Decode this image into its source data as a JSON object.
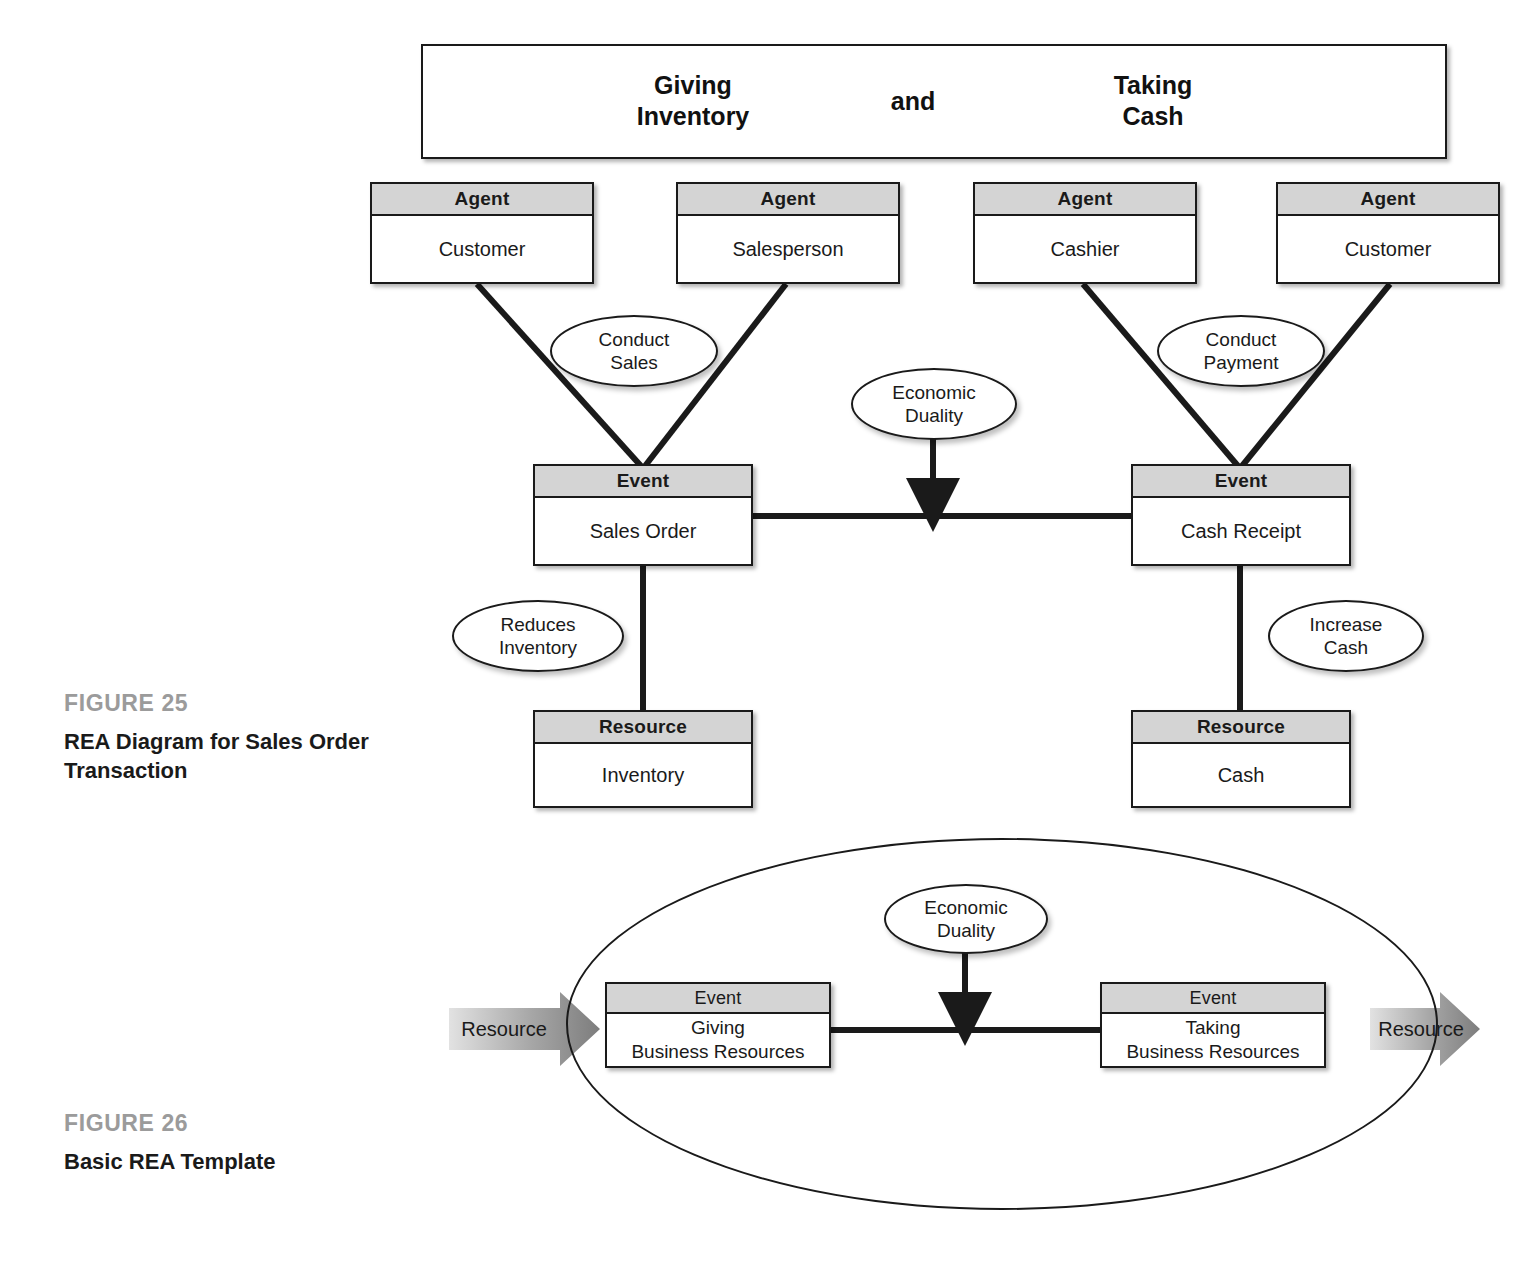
{
  "figure25": {
    "caption_number": "FIGURE 25",
    "caption_title": "REA Diagram for Sales Order Transaction",
    "banner": {
      "left": "Giving\nInventory",
      "left_line1": "Giving",
      "left_line2": "Inventory",
      "middle": "and",
      "right_line1": "Taking",
      "right_line2": "Cash"
    },
    "agents": [
      {
        "header": "Agent",
        "name": "Customer"
      },
      {
        "header": "Agent",
        "name": "Salesperson"
      },
      {
        "header": "Agent",
        "name": "Cashier"
      },
      {
        "header": "Agent",
        "name": "Customer"
      }
    ],
    "events": [
      {
        "header": "Event",
        "name": "Sales Order"
      },
      {
        "header": "Event",
        "name": "Cash Receipt"
      }
    ],
    "resources": [
      {
        "header": "Resource",
        "name": "Inventory"
      },
      {
        "header": "Resource",
        "name": "Cash"
      }
    ],
    "relationships": [
      {
        "line1": "Conduct",
        "line2": "Sales"
      },
      {
        "line1": "Conduct",
        "line2": "Payment"
      },
      {
        "line1": "Economic",
        "line2": "Duality"
      },
      {
        "line1": "Reduces",
        "line2": "Inventory"
      },
      {
        "line1": "Increase",
        "line2": "Cash"
      }
    ]
  },
  "figure26": {
    "caption_number": "FIGURE 26",
    "caption_title": "Basic REA Template",
    "events": [
      {
        "header": "Event",
        "line1": "Giving",
        "line2": "Business Resources"
      },
      {
        "header": "Event",
        "line1": "Taking",
        "line2": "Business Resources"
      }
    ],
    "duality": {
      "line1": "Economic",
      "line2": "Duality"
    },
    "resource_in_label": "Resource",
    "resource_out_label": "Resource"
  },
  "colors": {
    "header_fill": "#d4d4d4",
    "stroke": "#1a1a1a",
    "figure_number": "#9b9b9b",
    "arrow_gray": "#8c8c8c",
    "page_background": "#ffffff"
  }
}
